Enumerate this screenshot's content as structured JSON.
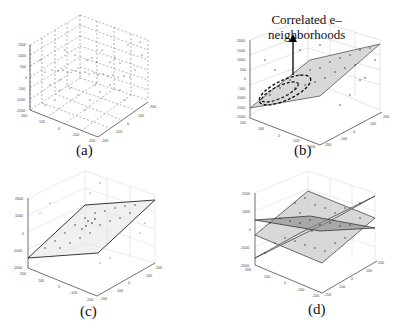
{
  "figure": {
    "panels": [
      {
        "id": "a",
        "caption": "(a)",
        "description": "Raw 3D point cloud"
      },
      {
        "id": "b",
        "caption": "(b)",
        "description": "Plane fit with correlated e-neighborhoods"
      },
      {
        "id": "c",
        "caption": "(c)",
        "description": "Single fitted plane"
      },
      {
        "id": "d",
        "caption": "(d)",
        "description": "Multiple intersecting planes"
      }
    ],
    "annotation": {
      "line1": "Correlated e–",
      "line2": "neighborhoods"
    }
  },
  "axes": {
    "a": {
      "z_ticks": [
        "1500",
        "1000",
        "500",
        "0",
        "-500",
        "-1000",
        "-1500"
      ],
      "x_ticks": [
        "200",
        "100",
        "0",
        "-100",
        "-200"
      ],
      "y_ticks": [
        "200",
        "100",
        "0",
        "-100",
        "-200"
      ]
    },
    "b": {
      "z_ticks": [
        "2000",
        "1500",
        "1000",
        "500",
        "0",
        "-500",
        "-1000",
        "-1500",
        "-2000"
      ],
      "x_ticks": [
        "200",
        "100",
        "0",
        "-100",
        "-200"
      ],
      "y_ticks": [
        "200",
        "100",
        "0",
        "-100",
        "-200"
      ]
    },
    "c": {
      "z_ticks": [
        "2000",
        "1000",
        "0",
        "-1000",
        "-2000"
      ],
      "x_ticks": [
        "200",
        "100",
        "0",
        "-100",
        "-200"
      ],
      "y_ticks": [
        "200",
        "100",
        "0",
        "-100",
        "-200"
      ]
    },
    "d": {
      "z_ticks": [
        "2000",
        "1000",
        "0",
        "-1000",
        "-2000"
      ],
      "x_ticks": [
        "200",
        "100",
        "0",
        "-100",
        "-200"
      ],
      "y_ticks": [
        "200",
        "100",
        "0",
        "-100",
        "-200"
      ]
    }
  }
}
